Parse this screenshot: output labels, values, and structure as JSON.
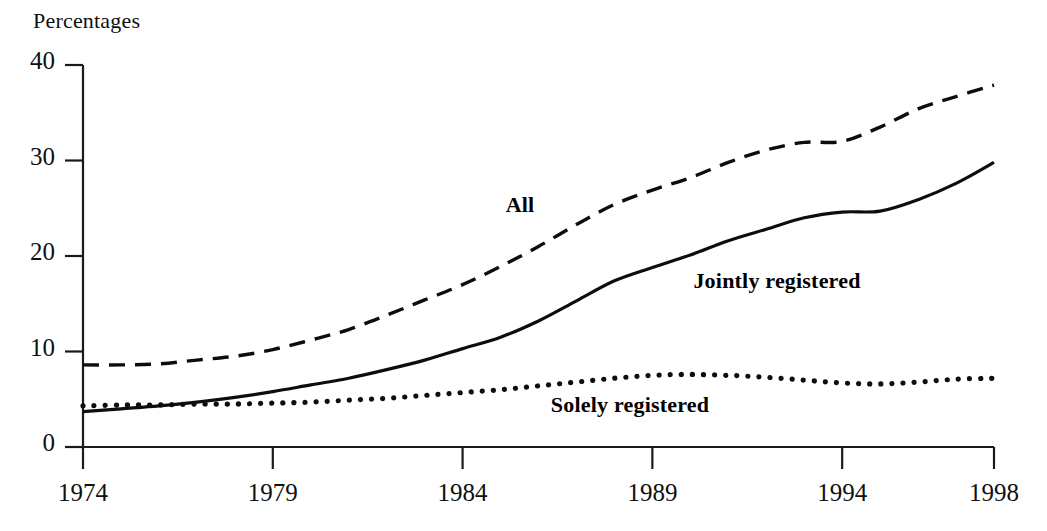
{
  "chart_data": {
    "type": "line",
    "title": "",
    "ylabel": "Percentages",
    "xlabel": "",
    "ylim": [
      0,
      40
    ],
    "xlim": [
      1974,
      1998
    ],
    "yticks": [
      0,
      10,
      20,
      30,
      40
    ],
    "ytick_labels": [
      "0",
      "10",
      "20",
      "30",
      "40"
    ],
    "xticks": [
      1974,
      1979,
      1984,
      1989,
      1994,
      1998
    ],
    "xtick_labels": [
      "1974",
      "1979",
      "1984",
      "1989",
      "1994",
      "1998"
    ],
    "grid": false,
    "legend": "inline-labels",
    "x": [
      1974,
      1975,
      1976,
      1977,
      1978,
      1979,
      1980,
      1981,
      1982,
      1983,
      1984,
      1985,
      1986,
      1987,
      1988,
      1989,
      1990,
      1991,
      1992,
      1993,
      1994,
      1995,
      1996,
      1997,
      1998
    ],
    "series": [
      {
        "name": "All",
        "style": "dashed",
        "label": "All",
        "label_x": 520,
        "label_y": 205,
        "values": [
          8.6,
          8.6,
          8.7,
          9.1,
          9.5,
          10.2,
          11.2,
          12.3,
          13.8,
          15.4,
          17.0,
          18.9,
          21.0,
          23.3,
          25.4,
          26.9,
          28.2,
          29.8,
          31.1,
          31.9,
          32.0,
          33.5,
          35.4,
          36.7,
          37.9
        ]
      },
      {
        "name": "Jointly registered",
        "style": "solid",
        "label": "Jointly registered",
        "label_x": 777,
        "label_y": 281,
        "values": [
          3.7,
          4.0,
          4.3,
          4.7,
          5.2,
          5.8,
          6.5,
          7.2,
          8.1,
          9.1,
          10.3,
          11.5,
          13.2,
          15.3,
          17.4,
          18.8,
          20.1,
          21.6,
          22.8,
          24.0,
          24.6,
          24.7,
          25.9,
          27.6,
          29.8
        ]
      },
      {
        "name": "Solely registered",
        "style": "dotted",
        "label": "Solely registered",
        "label_x": 630,
        "label_y": 405,
        "values": [
          4.3,
          4.4,
          4.4,
          4.5,
          4.5,
          4.6,
          4.7,
          4.9,
          5.1,
          5.4,
          5.7,
          6.0,
          6.4,
          6.8,
          7.2,
          7.5,
          7.6,
          7.5,
          7.3,
          7.0,
          6.7,
          6.6,
          6.8,
          7.1,
          7.2
        ]
      }
    ]
  },
  "chart_layout": {
    "plot_left": 83,
    "plot_right": 994,
    "plot_top": 65,
    "plot_bottom": 447,
    "ylabel_x": 33,
    "ylabel_y": 10
  }
}
